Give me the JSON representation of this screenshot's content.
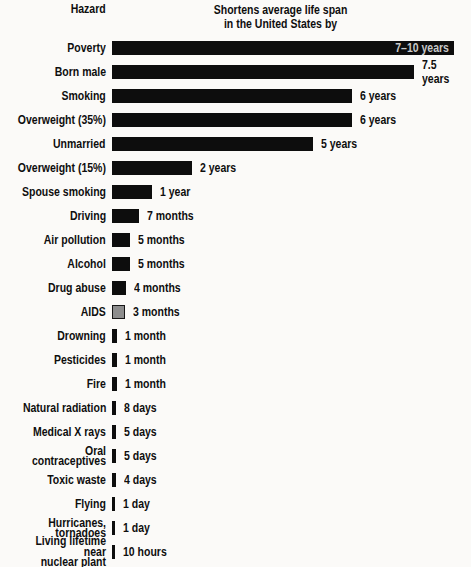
{
  "header": {
    "hazard": "Hazard",
    "title": "Shortens average life span\nin the United States by"
  },
  "chart_data": {
    "type": "bar",
    "orientation": "horizontal",
    "title": "Shortens average life span in the United States by",
    "category_header": "Hazard",
    "bar_color_default": "#0d0d0d",
    "value_inside_color": "#c9c9c9",
    "rows": [
      {
        "label": "Poverty",
        "value": "7–10 years",
        "bar_width": 342,
        "value_inside": true
      },
      {
        "label": "Born male",
        "value": "7.5 years",
        "bar_width": 302
      },
      {
        "label": "Smoking",
        "value": "6 years",
        "bar_width": 240
      },
      {
        "label": "Overweight (35%)",
        "value": "6 years",
        "bar_width": 240
      },
      {
        "label": "Unmarried",
        "value": "5 years",
        "bar_width": 201
      },
      {
        "label": "Overweight (15%)",
        "value": "2 years",
        "bar_width": 80
      },
      {
        "label": "Spouse smoking",
        "value": "1 year",
        "bar_width": 40
      },
      {
        "label": "Driving",
        "value": "7 months",
        "bar_width": 27
      },
      {
        "label": "Air pollution",
        "value": "5 months",
        "bar_width": 18
      },
      {
        "label": "Alcohol",
        "value": "5 months",
        "bar_width": 18
      },
      {
        "label": "Drug abuse",
        "value": "4 months",
        "bar_width": 14
      },
      {
        "label": "AIDS",
        "value": "3 months",
        "bar_width": 13,
        "bar_color": "#8d8d8d",
        "bar_border": "#161616"
      },
      {
        "label": "Drowning",
        "value": "1 month",
        "bar_width": 5
      },
      {
        "label": "Pesticides",
        "value": "1 month",
        "bar_width": 5
      },
      {
        "label": "Fire",
        "value": "1 month",
        "bar_width": 5
      },
      {
        "label": "Natural radiation",
        "value": "8 days",
        "bar_width": 4
      },
      {
        "label": "Medical X rays",
        "value": "5 days",
        "bar_width": 3.5
      },
      {
        "label": "Oral contraceptives",
        "value": "5 days",
        "bar_width": 3.5
      },
      {
        "label": "Toxic waste",
        "value": "4 days",
        "bar_width": 3.5
      },
      {
        "label": "Flying",
        "value": "1 day",
        "bar_width": 3
      },
      {
        "label": "Hurricanes, tornadoes",
        "value": "1 day",
        "bar_width": 3
      },
      {
        "label": "Living lifetime near\nnuclear plant",
        "value": "10 hours",
        "bar_width": 2.5
      }
    ]
  }
}
